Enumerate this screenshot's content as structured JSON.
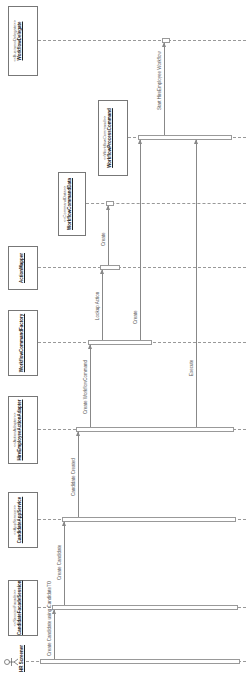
{
  "diagram": {
    "type": "sequence",
    "orientation": "rotated-90-ccw",
    "actor": {
      "name": "HR Screener"
    },
    "participants": [
      {
        "stereotype": "<<SessionFacade>>",
        "name": "CandidateFacadeSession"
      },
      {
        "stereotype": "<<AppService>>",
        "name": "CandidateAppService"
      },
      {
        "stereotype": "<<ActionAdapter>>",
        "name": "HireEmployeeActionAdapter"
      },
      {
        "stereotype": "",
        "name": "WorkflowCommandFactory"
      },
      {
        "stereotype": "",
        "name": "ActionMapper"
      },
      {
        "stereotype": "<<CommandData>>",
        "name": "WorkflowCommandData"
      },
      {
        "stereotype": "<<WorkflowCommand>>",
        "name": "WorkflowProcessCommand"
      },
      {
        "stereotype": "<<BusinessDelegate>>",
        "name": "WorkflowDelegate"
      }
    ],
    "messages": [
      {
        "label": "Create Candidate using CandidateTO",
        "from": "HR Screener",
        "to": "CandidateFacadeSession"
      },
      {
        "label": "Create Candidate",
        "from": "CandidateFacadeSession",
        "to": "CandidateAppService"
      },
      {
        "label": "Candidate Created",
        "from": "CandidateAppService",
        "to": "HireEmployeeActionAdapter"
      },
      {
        "label": "Create WorkflowCommand",
        "from": "HireEmployeeActionAdapter",
        "to": "WorkflowCommandFactory"
      },
      {
        "label": "Lookup Action",
        "from": "WorkflowCommandFactory",
        "to": "ActionMapper"
      },
      {
        "label": "Create",
        "from": "ActionMapper",
        "to": "WorkflowCommandData"
      },
      {
        "label": "Create",
        "from": "WorkflowCommandFactory",
        "to": "WorkflowProcessCommand"
      },
      {
        "label": "Execute",
        "from": "HireEmployeeActionAdapter",
        "to": "WorkflowProcessCommand"
      },
      {
        "label": "Start HireEmployee Workflow",
        "from": "WorkflowProcessCommand",
        "to": "WorkflowDelegate"
      }
    ]
  }
}
